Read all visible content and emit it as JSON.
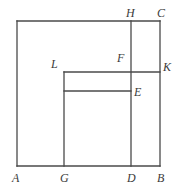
{
  "figure": {
    "kind": "plane-geometry-diagram",
    "canvas": {
      "width": 185,
      "height": 193
    },
    "stroke_color": "#4a4a4a",
    "label_color": "#3b3b3b",
    "background_color": "#ffffff",
    "stroke_width": 1.3,
    "points": {
      "A": {
        "x": 17,
        "y": 166,
        "label": "A",
        "label_x": 12,
        "label_y": 172
      },
      "B": {
        "x": 160,
        "y": 166,
        "label": "B",
        "label_x": 157,
        "label_y": 172
      },
      "C": {
        "x": 160,
        "y": 21,
        "label": "C",
        "label_x": 157,
        "label_y": 7
      },
      "D": {
        "x": 131,
        "y": 166,
        "label": "D",
        "label_x": 127,
        "label_y": 172
      },
      "E": {
        "x": 131,
        "y": 91,
        "label": "E",
        "label_x": 134,
        "label_y": 86
      },
      "F": {
        "x": 131,
        "y": 72,
        "label": "F",
        "label_x": 117,
        "label_y": 52
      },
      "G": {
        "x": 64,
        "y": 166,
        "label": "G",
        "label_x": 60,
        "label_y": 172
      },
      "H": {
        "x": 131,
        "y": 21,
        "label": "H",
        "label_x": 126,
        "label_y": 7
      },
      "K": {
        "x": 160,
        "y": 72,
        "label": "K",
        "label_x": 163,
        "label_y": 61
      },
      "L": {
        "x": 64,
        "y": 72,
        "label": "L",
        "label_x": 51,
        "label_y": 58
      },
      "TOPLEFT": {
        "x": 17,
        "y": 21
      },
      "M": {
        "x": 64,
        "y": 91
      }
    },
    "segments": [
      {
        "name": "square-side-top",
        "from": "TOPLEFT",
        "to": "C"
      },
      {
        "name": "square-side-right",
        "from": "C",
        "to": "B"
      },
      {
        "name": "square-side-bottom",
        "from": "B",
        "to": "A"
      },
      {
        "name": "square-side-left",
        "from": "A",
        "to": "TOPLEFT"
      },
      {
        "name": "segment-HD",
        "from": "H",
        "to": "D"
      },
      {
        "name": "segment-LK",
        "from": "L",
        "to": "K"
      },
      {
        "name": "segment-LG",
        "from": "L",
        "to": "G"
      },
      {
        "name": "segment-ME",
        "from": "M",
        "to": "E"
      }
    ],
    "labels_order": [
      "H",
      "C",
      "L",
      "F",
      "K",
      "E",
      "A",
      "G",
      "D",
      "B"
    ]
  }
}
